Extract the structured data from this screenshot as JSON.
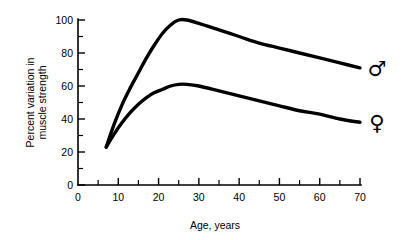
{
  "chart_data": {
    "type": "line",
    "title": "",
    "xlabel": "Age, years",
    "ylabel": "Percent variation in muscle strength",
    "ylabel_line1": "Percent variation in",
    "ylabel_line2": "muscle strength",
    "xlim": [
      0,
      70
    ],
    "ylim": [
      0,
      100
    ],
    "grid": false,
    "legend_position": "right-of-curve-ends",
    "x_ticks_major": [
      0,
      10,
      20,
      30,
      40,
      50,
      60,
      70
    ],
    "x_ticks_minor": [
      5,
      15,
      25,
      35,
      45,
      55,
      65
    ],
    "x_tick_labels": [
      "0",
      "10",
      "20",
      "30",
      "40",
      "50",
      "60",
      "70"
    ],
    "y_ticks_major": [
      0,
      20,
      40,
      60,
      80,
      100
    ],
    "y_ticks_minor": [
      10,
      30,
      50,
      70,
      90
    ],
    "y_tick_labels": [
      "0",
      "20",
      "40",
      "60",
      "80",
      "100"
    ],
    "series": [
      {
        "name": "male",
        "symbol": "♂",
        "label_glyph": "mars-symbol",
        "color": "#000000",
        "line_width": 3.4,
        "peak": {
          "x": 25,
          "y": 100
        },
        "x": [
          7,
          9,
          11,
          13,
          15,
          17,
          19,
          21,
          23,
          25,
          27,
          30,
          35,
          40,
          45,
          50,
          55,
          60,
          65,
          70
        ],
        "values": [
          23,
          37,
          49,
          59,
          68,
          77,
          85,
          92,
          97,
          100,
          100,
          98,
          94,
          90,
          86,
          83,
          80,
          77,
          74,
          71
        ]
      },
      {
        "name": "female",
        "symbol": "♀",
        "label_glyph": "venus-symbol",
        "color": "#000000",
        "line_width": 3.4,
        "peak": {
          "x": 25,
          "y": 61
        },
        "x": [
          7,
          9,
          11,
          13,
          15,
          17,
          19,
          21,
          23,
          25,
          27,
          30,
          35,
          40,
          45,
          50,
          55,
          60,
          65,
          70
        ],
        "values": [
          23,
          31,
          38,
          44,
          49,
          53,
          56,
          58,
          60,
          61,
          61,
          60,
          57,
          54,
          51,
          48,
          45,
          43,
          40,
          38
        ]
      }
    ]
  },
  "markers": {
    "male_symbol": "♂",
    "female_symbol": "♀"
  }
}
